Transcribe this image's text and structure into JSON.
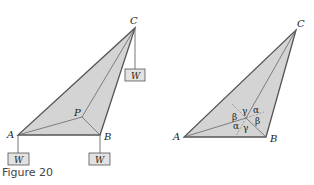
{
  "figure": {
    "caption": "Figure 20",
    "colors": {
      "fill": "#d4d4d4",
      "stroke": "#555555",
      "thin": "#666666",
      "box_fill": "#e2e2e2"
    },
    "left_diagram": {
      "vertices": {
        "A": "A",
        "B": "B",
        "C": "C",
        "P": "P"
      },
      "weights": [
        "W",
        "W",
        "W"
      ]
    },
    "right_diagram": {
      "vertices": {
        "A": "A",
        "B": "B",
        "C": "C"
      },
      "angles": [
        "γ",
        "α",
        "β",
        "β",
        "α",
        "γ"
      ]
    }
  }
}
